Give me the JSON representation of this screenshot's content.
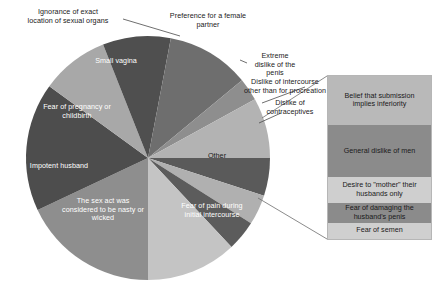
{
  "chart_data": {
    "type": "pie",
    "title": "",
    "subtitle": "",
    "xlabel": "",
    "ylabel": "",
    "legend_position": "none",
    "grid": false,
    "units": "percent",
    "note": "Pie of reasons, with the 'Other' wedge exploded into a stacked sub-bar on the right.",
    "categories": [
      "Fear of pain during initial intercourse",
      "The sex act was considered to be nasty or wicked",
      "Impotent husband",
      "Fear of pregnancy or childbirth",
      "Small vagina",
      "Ignorance of exact location of sexual organs",
      "Preference for a female partner",
      "Extreme dislike of the penis",
      "Dislike of intercourse other than for procreation",
      "Dislike of contraceptives",
      "Other"
    ],
    "values": [
      18,
      17,
      9,
      9,
      11,
      3,
      8,
      5,
      4,
      4,
      12
    ],
    "colors": [
      "#8e8e8e",
      "#4d4d4d",
      "#a8a8a8",
      "#4f4f4f",
      "#6e6e6e",
      "#8e8e8e",
      "#b3b3b3",
      "#5a5a5a",
      "#b0b0b0",
      "#5c5c5c",
      "#c4c4c4"
    ],
    "exploded_slice": "Other",
    "breakdown": {
      "parent": "Other",
      "type": "stacked-bar",
      "categories": [
        "Belief that submission implies inferiority",
        "General dislike of men",
        "Desire to \"mother\" their husbands only",
        "Fear of damaging the husband's penis",
        "Fear of semen"
      ],
      "values": [
        30,
        32,
        16,
        12,
        10
      ],
      "colors": [
        "#b9b9b9",
        "#8b8b8b",
        "#cfcfcf",
        "#8b8b8b",
        "#cfcfcf"
      ],
      "text_colors": [
        "#1a1a1a",
        "#1a1a1a",
        "#1a1a1a",
        "#1a1a1a",
        "#1a1a1a"
      ]
    }
  },
  "pie": {
    "slices": [
      {
        "label": "Fear of pain during initial intercourse"
      },
      {
        "label": "The sex act was considered to be nasty or wicked"
      },
      {
        "label": "Impotent husband"
      },
      {
        "label": "Fear of pregnancy or childbirth"
      },
      {
        "label": "Small vagina"
      },
      {
        "label": "Ignorance of exact location of sexual organs"
      },
      {
        "label": "Preference for a female partner"
      },
      {
        "label": "Extreme dislike of the penis"
      },
      {
        "label": "Dislike of intercourse other than for procreation"
      },
      {
        "label": "Dislike of contraceptives"
      },
      {
        "label": "Other"
      }
    ]
  },
  "labels": {
    "ignorance": "Ignorance of exact\nlocation of sexual organs",
    "preference_female": "Preference for a female\npartner",
    "extreme_dislike_penis": "Extreme\ndislike of the\npenis",
    "dislike_intercourse": "Dislike of intercourse\nother than for procreation",
    "dislike_contraceptives": "Dislike of\ncontraceptives",
    "small_vagina": "Small vagina",
    "fear_pregnancy": "Fear of pregnancy or\nchildbirth",
    "impotent_husband": "Impotent husband",
    "sex_act_nasty": "The sex act was\nconsidered to be nasty or\nwicked",
    "fear_pain": "Fear of pain during\ninitial intercourse",
    "other": "Other"
  },
  "other_box": {
    "segments": [
      {
        "label": "Belief that submission\nimplies inferiority"
      },
      {
        "label": "General dislike of men"
      },
      {
        "label": "Desire to \"mother\" their\nhusbands only"
      },
      {
        "label": "Fear of damaging the\nhusband's penis"
      },
      {
        "label": "Fear of semen"
      }
    ]
  }
}
